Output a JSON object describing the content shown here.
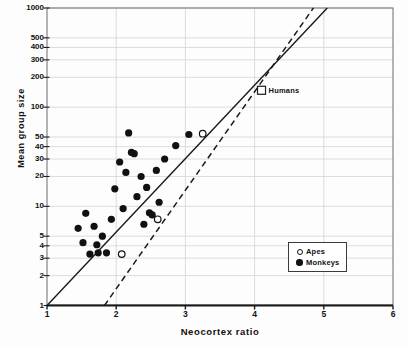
{
  "chart_data": {
    "type": "scatter",
    "title": "",
    "xlabel": "Neocortex ratio",
    "ylabel": "Mean group size",
    "xscale": "linear",
    "yscale": "log",
    "xlim": [
      1,
      6
    ],
    "ylim": [
      1,
      1000
    ],
    "grid": true,
    "grid_axis": "y",
    "legend_position": "lower-right",
    "xticks": [
      1,
      2,
      3,
      4,
      5,
      6
    ],
    "xtick_labels": [
      "1",
      "2",
      "3",
      "4",
      "5",
      "6"
    ],
    "yticks": [
      1,
      2,
      3,
      4,
      5,
      10,
      20,
      30,
      40,
      50,
      100,
      200,
      300,
      400,
      500,
      1000
    ],
    "ytick_labels": [
      "1",
      "2",
      "3",
      "4",
      "5",
      "10",
      "20",
      "30",
      "40",
      "50",
      "100",
      "200",
      "300",
      "400",
      "500",
      "1000"
    ],
    "legend": [
      {
        "key": "apes",
        "label": "Apes",
        "marker": "open-circle"
      },
      {
        "key": "monkeys",
        "label": "Monkeys",
        "marker": "filled-circle"
      }
    ],
    "annotations": [
      {
        "key": "humans",
        "label": "Humans",
        "marker": "open-square",
        "x": 4.1,
        "y": 148
      }
    ],
    "series": [
      {
        "name": "Monkeys",
        "marker": "filled-circle",
        "color": "#111111",
        "points": [
          [
            1.45,
            6.0
          ],
          [
            1.52,
            4.3
          ],
          [
            1.56,
            8.5
          ],
          [
            1.62,
            3.3
          ],
          [
            1.68,
            6.3
          ],
          [
            1.72,
            4.1
          ],
          [
            1.74,
            3.4
          ],
          [
            1.8,
            5.0
          ],
          [
            1.86,
            3.4
          ],
          [
            1.93,
            7.4
          ],
          [
            1.98,
            15.0
          ],
          [
            2.05,
            28.0
          ],
          [
            2.1,
            9.5
          ],
          [
            2.14,
            22.0
          ],
          [
            2.18,
            55.0
          ],
          [
            2.22,
            35.0
          ],
          [
            2.26,
            34.0
          ],
          [
            2.3,
            12.5
          ],
          [
            2.36,
            20.0
          ],
          [
            2.4,
            6.6
          ],
          [
            2.44,
            15.5
          ],
          [
            2.48,
            8.6
          ],
          [
            2.52,
            8.2
          ],
          [
            2.58,
            23.0
          ],
          [
            2.62,
            11.0
          ],
          [
            2.7,
            30.0
          ],
          [
            2.86,
            41.0
          ],
          [
            3.05,
            53.0
          ]
        ]
      },
      {
        "name": "Apes",
        "marker": "open-circle",
        "color": "#111111",
        "points": [
          [
            2.08,
            3.3
          ],
          [
            2.6,
            7.4
          ],
          [
            3.25,
            54.0
          ]
        ]
      }
    ],
    "trend_lines": [
      {
        "key": "solid-regression",
        "style": "solid",
        "description": "Monkey regression line",
        "start": [
          1.0,
          1.0
        ],
        "end": [
          5.05,
          1000
        ]
      },
      {
        "key": "dashed-regression",
        "style": "dashed",
        "description": "Ape regression line",
        "start": [
          1.83,
          1.0
        ],
        "end": [
          4.85,
          1000
        ]
      }
    ]
  },
  "axes": {
    "x_title": "Neocortex ratio",
    "y_title": "Mean group size"
  }
}
